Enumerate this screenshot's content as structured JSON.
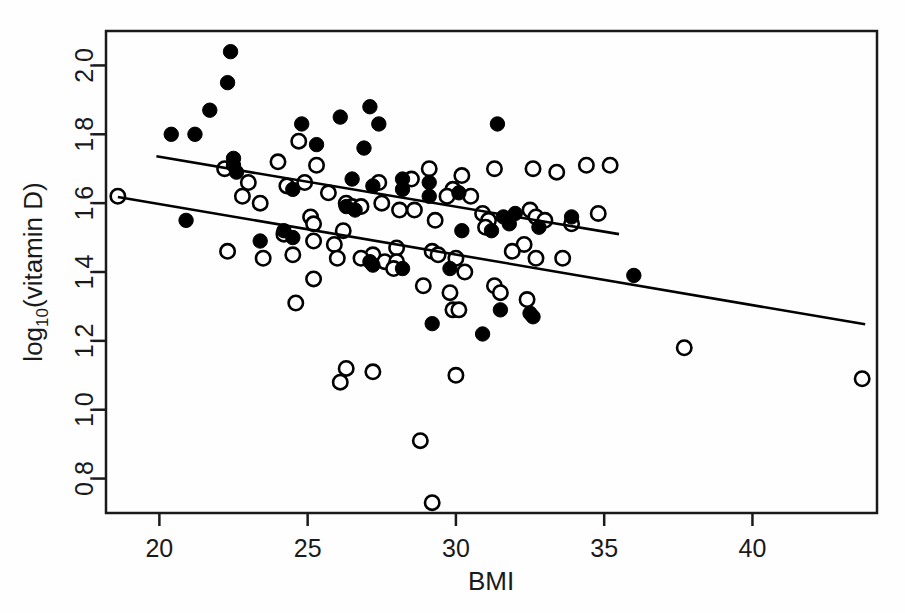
{
  "chart_data": {
    "type": "scatter",
    "title": "",
    "xlabel": "BMI",
    "ylabel": "log10(vitamin D)",
    "ylabel_base": "log",
    "ylabel_sub": "10",
    "ylabel_rest": "(vitamin D)",
    "xlim": [
      18.2,
      44.2
    ],
    "ylim": [
      0.7,
      2.1
    ],
    "xticks": [
      20,
      25,
      30,
      35,
      40
    ],
    "xtick_labels": [
      "20",
      "25",
      "30",
      "35",
      "40"
    ],
    "yticks": [
      0.8,
      1.0,
      1.2,
      1.4,
      1.6,
      1.8,
      2.0
    ],
    "ytick_labels": [
      "0.8",
      "1.0",
      "1.2",
      "1.4",
      "1.6",
      "1.8",
      "2.0"
    ],
    "grid": false,
    "legend": "none",
    "point_color": "#000000",
    "line_color": "#000000",
    "series": [
      {
        "name": "filled",
        "marker": "filled-circle",
        "points": [
          [
            22.4,
            2.04
          ],
          [
            22.3,
            1.95
          ],
          [
            21.7,
            1.87
          ],
          [
            20.4,
            1.8
          ],
          [
            21.2,
            1.8
          ],
          [
            27.1,
            1.88
          ],
          [
            26.1,
            1.85
          ],
          [
            24.8,
            1.83
          ],
          [
            27.4,
            1.83
          ],
          [
            31.4,
            1.83
          ],
          [
            25.3,
            1.77
          ],
          [
            26.9,
            1.76
          ],
          [
            22.5,
            1.73
          ],
          [
            22.5,
            1.71
          ],
          [
            22.6,
            1.69
          ],
          [
            26.5,
            1.67
          ],
          [
            28.2,
            1.67
          ],
          [
            29.1,
            1.66
          ],
          [
            28.2,
            1.64
          ],
          [
            24.5,
            1.64
          ],
          [
            27.2,
            1.65
          ],
          [
            30.1,
            1.63
          ],
          [
            29.1,
            1.62
          ],
          [
            26.3,
            1.59
          ],
          [
            26.6,
            1.58
          ],
          [
            32.0,
            1.57
          ],
          [
            31.6,
            1.56
          ],
          [
            31.8,
            1.54
          ],
          [
            20.9,
            1.55
          ],
          [
            24.2,
            1.52
          ],
          [
            32.8,
            1.53
          ],
          [
            33.9,
            1.56
          ],
          [
            31.2,
            1.52
          ],
          [
            30.2,
            1.52
          ],
          [
            24.5,
            1.5
          ],
          [
            23.4,
            1.49
          ],
          [
            27.1,
            1.43
          ],
          [
            27.2,
            1.42
          ],
          [
            29.8,
            1.41
          ],
          [
            28.2,
            1.41
          ],
          [
            31.5,
            1.29
          ],
          [
            32.5,
            1.28
          ],
          [
            32.6,
            1.27
          ],
          [
            29.2,
            1.25
          ],
          [
            30.9,
            1.22
          ],
          [
            36.0,
            1.39
          ]
        ]
      },
      {
        "name": "open",
        "marker": "open-circle",
        "points": [
          [
            24.7,
            1.78
          ],
          [
            24.0,
            1.72
          ],
          [
            25.3,
            1.71
          ],
          [
            29.1,
            1.7
          ],
          [
            31.3,
            1.7
          ],
          [
            32.6,
            1.7
          ],
          [
            34.4,
            1.71
          ],
          [
            35.2,
            1.71
          ],
          [
            22.2,
            1.7
          ],
          [
            30.2,
            1.68
          ],
          [
            33.4,
            1.69
          ],
          [
            28.5,
            1.67
          ],
          [
            27.4,
            1.66
          ],
          [
            29.9,
            1.64
          ],
          [
            24.9,
            1.66
          ],
          [
            24.3,
            1.65
          ],
          [
            23.0,
            1.66
          ],
          [
            25.7,
            1.63
          ],
          [
            29.7,
            1.62
          ],
          [
            30.5,
            1.62
          ],
          [
            22.8,
            1.62
          ],
          [
            27.5,
            1.6
          ],
          [
            26.3,
            1.6
          ],
          [
            26.5,
            1.59
          ],
          [
            26.8,
            1.59
          ],
          [
            28.1,
            1.58
          ],
          [
            28.6,
            1.58
          ],
          [
            32.5,
            1.58
          ],
          [
            32.7,
            1.56
          ],
          [
            30.9,
            1.57
          ],
          [
            31.1,
            1.55
          ],
          [
            18.6,
            1.62
          ],
          [
            23.4,
            1.6
          ],
          [
            25.1,
            1.56
          ],
          [
            25.2,
            1.54
          ],
          [
            33.9,
            1.54
          ],
          [
            34.8,
            1.57
          ],
          [
            33.0,
            1.55
          ],
          [
            29.3,
            1.55
          ],
          [
            31.0,
            1.53
          ],
          [
            26.2,
            1.52
          ],
          [
            24.2,
            1.51
          ],
          [
            22.3,
            1.46
          ],
          [
            25.2,
            1.49
          ],
          [
            25.9,
            1.48
          ],
          [
            32.3,
            1.48
          ],
          [
            27.2,
            1.45
          ],
          [
            28.0,
            1.47
          ],
          [
            26.0,
            1.44
          ],
          [
            26.8,
            1.44
          ],
          [
            29.2,
            1.46
          ],
          [
            29.4,
            1.45
          ],
          [
            23.5,
            1.44
          ],
          [
            24.5,
            1.45
          ],
          [
            27.6,
            1.43
          ],
          [
            28.0,
            1.43
          ],
          [
            30.0,
            1.44
          ],
          [
            31.9,
            1.46
          ],
          [
            32.7,
            1.44
          ],
          [
            33.6,
            1.44
          ],
          [
            27.9,
            1.41
          ],
          [
            30.3,
            1.4
          ],
          [
            25.2,
            1.38
          ],
          [
            28.9,
            1.36
          ],
          [
            29.8,
            1.34
          ],
          [
            31.3,
            1.36
          ],
          [
            31.5,
            1.34
          ],
          [
            32.4,
            1.32
          ],
          [
            24.6,
            1.31
          ],
          [
            29.9,
            1.29
          ],
          [
            30.1,
            1.29
          ],
          [
            26.3,
            1.12
          ],
          [
            27.2,
            1.11
          ],
          [
            26.1,
            1.08
          ],
          [
            30.0,
            1.1
          ],
          [
            37.7,
            1.18
          ],
          [
            43.7,
            1.09
          ],
          [
            28.8,
            0.91
          ],
          [
            29.2,
            0.73
          ]
        ]
      }
    ],
    "trend_lines": [
      {
        "name": "upper-regression-line",
        "x1": 19.9,
        "y1": 1.736,
        "x2": 35.5,
        "y2": 1.51
      },
      {
        "name": "lower-regression-line",
        "x1": 18.6,
        "y1": 1.618,
        "x2": 43.8,
        "y2": 1.248
      }
    ]
  },
  "plot_box": {
    "left": 106,
    "top": 31,
    "right": 877,
    "bottom": 513
  }
}
